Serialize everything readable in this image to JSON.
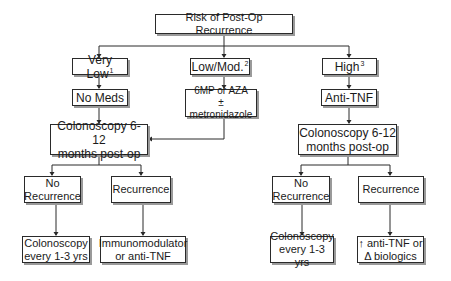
{
  "diagram": {
    "title": "Risk of Post-Op Recurrence",
    "risk_levels": [
      {
        "label": "Very Low",
        "footnote": "1"
      },
      {
        "label": "Low/Mod.",
        "footnote": "2"
      },
      {
        "label": "High",
        "footnote": "3"
      }
    ],
    "treatments": {
      "very_low": "No Meds",
      "low_mod_line1": "6MP or AZA",
      "low_mod_line2": "± metronidazole",
      "high": "Anti-TNF"
    },
    "colonoscopy_left": {
      "line1": "Colonoscopy 6-12",
      "line2": "months post-op"
    },
    "colonoscopy_right": {
      "line1": "Colonoscopy 6-12",
      "line2": "months post-op"
    },
    "left_outcomes": {
      "no_recurrence": {
        "line1": "No",
        "line2": "Recurrence"
      },
      "recurrence": "Recurrence",
      "no_rec_action": {
        "line1": "Colonoscopy",
        "line2": "every 1-3 yrs"
      },
      "rec_action": {
        "line1": "Immunomodulator",
        "line2": "or anti-TNF"
      }
    },
    "right_outcomes": {
      "no_recurrence": {
        "line1": "No",
        "line2": "Recurrence"
      },
      "recurrence": "Recurrence",
      "no_rec_action": {
        "line1": "Colonoscopy",
        "line2": "every 1-3 yrs"
      },
      "rec_action": {
        "line1": "↑ anti-TNF or",
        "line2": "Δ biologics"
      }
    }
  }
}
